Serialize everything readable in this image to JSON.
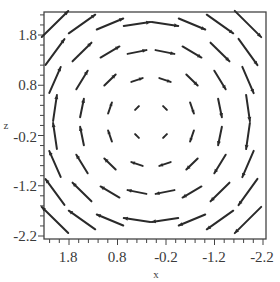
{
  "chart_data": {
    "type": "vector_field",
    "title": "",
    "xlabel": "x",
    "ylabel": "z",
    "x_reversed": true,
    "xlim": [
      2.3,
      -2.3
    ],
    "ylim": [
      -2.3,
      2.3
    ],
    "x_ticks": [
      1.8,
      0.8,
      -0.2,
      -1.2,
      -2.2
    ],
    "x_tick_labels": [
      "1.8",
      "0.8",
      "-0.2",
      "-1.2",
      "-2.2"
    ],
    "y_ticks": [
      1.8,
      0.8,
      -0.2,
      -1.2,
      -2.2
    ],
    "y_tick_labels": [
      "1.8",
      "0.8",
      "-0.2",
      "-1.2",
      "-2.2"
    ],
    "minor_tick_step": 0.2,
    "grid": false,
    "legend": null,
    "grid_size": [
      8,
      8
    ],
    "field_description": "circular rotation field; arrows point right along top, down along right edge, left along bottom, up along left edge; magnitude grows with distance from center",
    "arrow_color": "#2a2a2a"
  },
  "layout": {
    "frame": {
      "left": 44,
      "top": 12,
      "right": 266,
      "bottom": 239
    },
    "x_label_px": [
      69,
      118,
      167,
      215,
      263
    ],
    "y_label_px": [
      35,
      85,
      137,
      186,
      236
    ],
    "col_px": [
      55,
      82,
      110,
      137,
      165,
      192,
      220,
      248
    ],
    "row_px": [
      24,
      52,
      80,
      108,
      136,
      164,
      192,
      220
    ],
    "center_px": [
      151,
      122
    ]
  }
}
